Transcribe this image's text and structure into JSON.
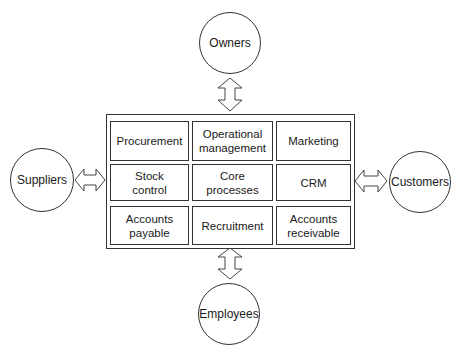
{
  "diagram": {
    "external_entities": {
      "top": "Owners",
      "left": "Suppliers",
      "right": "Customers",
      "bottom": "Employees"
    },
    "cells": [
      [
        "Procurement",
        "Operational management",
        "Marketing"
      ],
      [
        "Stock control",
        "Core processes",
        "CRM"
      ],
      [
        "Accounts payable",
        "Recruitment",
        "Accounts receivable"
      ]
    ],
    "connector_type": "double-headed-arrow"
  }
}
